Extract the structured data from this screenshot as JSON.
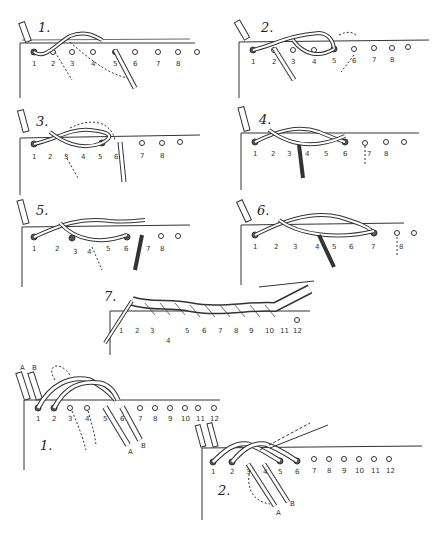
{
  "figure": {
    "single_lace_steps": [
      {
        "label": "1.",
        "holes": [
          "1",
          "2",
          "3",
          "4",
          "5",
          "6",
          "7",
          "8"
        ]
      },
      {
        "label": "2.",
        "holes": [
          "1",
          "2",
          "3",
          "4",
          "5",
          "6",
          "7",
          "8"
        ]
      },
      {
        "label": "3.",
        "holes": [
          "1",
          "2",
          "3",
          "4",
          "5",
          "6",
          "7",
          "8"
        ]
      },
      {
        "label": "4.",
        "holes": [
          "1",
          "2",
          "3",
          "4",
          "5",
          "6",
          "7",
          "8"
        ]
      },
      {
        "label": "5.",
        "holes": [
          "1",
          "2",
          "3",
          "4",
          "5",
          "6",
          "7",
          "8"
        ]
      },
      {
        "label": "6.",
        "holes": [
          "1",
          "2",
          "3",
          "4",
          "5",
          "6",
          "7",
          "8"
        ]
      },
      {
        "label": "7.",
        "holes": [
          "1",
          "2",
          "3",
          "4",
          "5",
          "6",
          "7",
          "8",
          "9",
          "10",
          "11",
          "12"
        ]
      }
    ],
    "double_lace_steps": [
      {
        "label": "1.",
        "holes": [
          "1",
          "2",
          "3",
          "4",
          "5",
          "6",
          "7",
          "8",
          "9",
          "10",
          "11",
          "12"
        ],
        "strands": [
          "A",
          "B"
        ],
        "needle_labels": [
          "A",
          "B"
        ]
      },
      {
        "label": "2.",
        "holes": [
          "1",
          "2",
          "3",
          "4",
          "5",
          "6",
          "7",
          "8",
          "9",
          "10",
          "11",
          "12"
        ],
        "strands": [
          "A",
          "B"
        ],
        "needle_labels": [
          "A",
          "B"
        ]
      }
    ]
  }
}
